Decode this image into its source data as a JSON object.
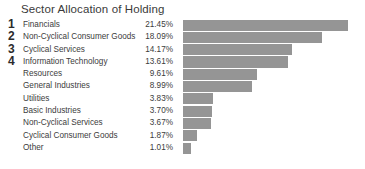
{
  "chart": {
    "title": "Sector Allocation of Holding"
  },
  "chart_data": {
    "type": "bar",
    "orientation": "horizontal",
    "title": "Sector Allocation of Holding",
    "xlabel": "",
    "ylabel": "",
    "grid": false,
    "legend": null,
    "xlim": [
      0,
      22.7
    ],
    "bar_color": "#959595",
    "value_suffix": "%",
    "categories": [
      "Financials",
      "Non-Cyclical Consumer Goods",
      "Cyclical Services",
      "Information Technology",
      "Resources",
      "General Industries",
      "Utilities",
      "Basic Industries",
      "Non-Cyclical Services",
      "Cyclical Consumer Goods",
      "Other"
    ],
    "values": [
      21.45,
      18.09,
      14.17,
      13.61,
      9.61,
      8.99,
      3.83,
      3.7,
      3.67,
      1.87,
      1.01
    ],
    "value_labels": [
      "21.45%",
      "18.09%",
      "14.17%",
      "13.61%",
      "9.61%",
      "8.99%",
      "3.83%",
      "3.70%",
      "3.67%",
      "1.87%",
      "1.01%"
    ],
    "ranks": [
      "1",
      "2",
      "3",
      "4",
      "",
      "",
      "",
      "",
      "",
      "",
      ""
    ],
    "rows": [
      {
        "rank": "1",
        "label": "Financials",
        "value": "21.45%",
        "pct": 21.45
      },
      {
        "rank": "2",
        "label": "Non-Cyclical Consumer Goods",
        "value": "18.09%",
        "pct": 18.09
      },
      {
        "rank": "3",
        "label": "Cyclical Services",
        "value": "14.17%",
        "pct": 14.17
      },
      {
        "rank": "4",
        "label": "Information Technology",
        "value": "13.61%",
        "pct": 13.61
      },
      {
        "rank": "",
        "label": "Resources",
        "value": "9.61%",
        "pct": 9.61
      },
      {
        "rank": "",
        "label": "General Industries",
        "value": "8.99%",
        "pct": 8.99
      },
      {
        "rank": "",
        "label": "Utilities",
        "value": "3.83%",
        "pct": 3.83
      },
      {
        "rank": "",
        "label": "Basic Industries",
        "value": "3.70%",
        "pct": 3.7
      },
      {
        "rank": "",
        "label": "Non-Cyclical Services",
        "value": "3.67%",
        "pct": 3.67
      },
      {
        "rank": "",
        "label": "Cyclical Consumer Goods",
        "value": "1.87%",
        "pct": 1.87
      },
      {
        "rank": "",
        "label": "Other",
        "value": "1.01%",
        "pct": 1.01
      }
    ]
  }
}
